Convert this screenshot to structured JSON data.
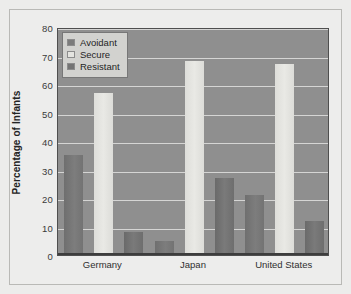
{
  "chart_data": {
    "type": "bar",
    "title": "",
    "xlabel": "",
    "ylabel": "Percentage of Infants",
    "ylim": [
      0,
      80
    ],
    "yticks": [
      0,
      10,
      20,
      30,
      40,
      50,
      60,
      70,
      80
    ],
    "grid": true,
    "legend_position": "top-left",
    "categories": [
      "Germany",
      "Japan",
      "United States"
    ],
    "series": [
      {
        "name": "Avoidant",
        "values": [
          35,
          5,
          21
        ]
      },
      {
        "name": "Secure",
        "values": [
          57,
          68,
          67
        ]
      },
      {
        "name": "Resistant",
        "values": [
          8,
          27,
          12
        ]
      }
    ]
  },
  "legend": {
    "items": [
      {
        "label": "Avoidant",
        "swatch": "avoidant"
      },
      {
        "label": "Secure",
        "swatch": "secure"
      },
      {
        "label": "Resistant",
        "swatch": "resistant"
      }
    ]
  },
  "colors": {
    "plot_background": "#8f8f8f",
    "figure_background": "#ededec",
    "gridline": "#e2e2e0",
    "avoidant": "#7b7b7b",
    "secure": "#e4e4e0",
    "resistant": "#747474",
    "axis": "#3d3d3d",
    "text": "#232323"
  },
  "axis": {
    "y_tick_labels": [
      "0",
      "10",
      "20",
      "30",
      "40",
      "50",
      "60",
      "70",
      "80"
    ],
    "x_tick_labels": [
      "Germany",
      "Japan",
      "United States"
    ],
    "y_title": "Percentage of Infants"
  }
}
